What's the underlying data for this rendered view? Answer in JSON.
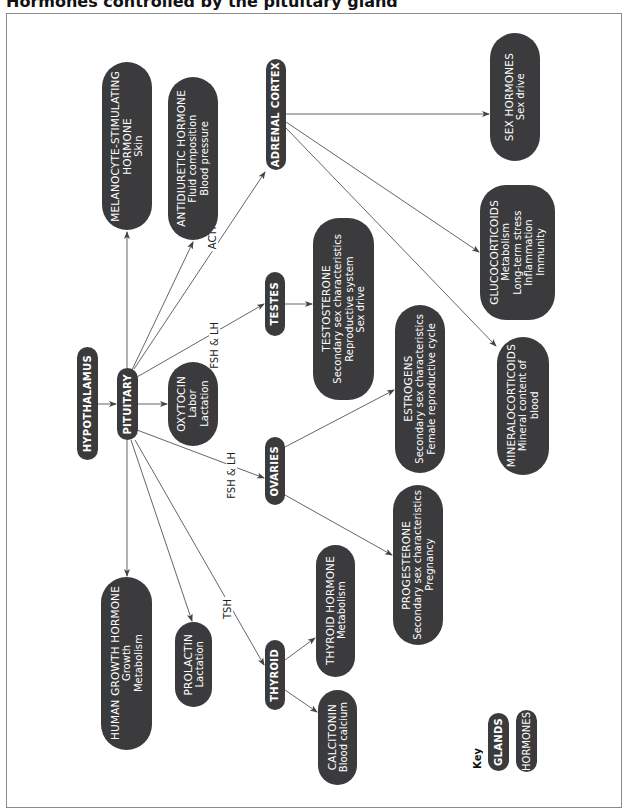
{
  "title": "Hormones controlled by the pituitary gland",
  "colors": {
    "node_fill": "#3b3b3d",
    "node_text": "#ffffff",
    "line": "#555555",
    "frame": "#8a8a8a"
  },
  "glands": {
    "hypothalamus": "HYPOTHALAMUS",
    "pituitary": "PITUITARY",
    "adrenal_cortex": "ADRENAL CORTEX",
    "testes": "TESTES",
    "ovaries": "OVARIES",
    "thyroid": "THYROID"
  },
  "hormones": {
    "msh": {
      "name": "MELANOCYTE-STIMULATING",
      "name2": "HORMONE",
      "effects": [
        "Skin"
      ]
    },
    "adh": {
      "name": "ANTIDIURETIC HORMONE",
      "effects": [
        "Fluid composition",
        "Blood pressure"
      ]
    },
    "oxytocin": {
      "name": "OXYTOCIN",
      "effects": [
        "Labor",
        "Lactation"
      ]
    },
    "hgh": {
      "name": "HUMAN GROWTH HORMONE",
      "effects": [
        "Growth",
        "Metabolism"
      ]
    },
    "prolactin": {
      "name": "PROLACTIN",
      "effects": [
        "Lactation"
      ]
    },
    "testosterone": {
      "name": "TESTOSTERONE",
      "effects": [
        "Secondary sex characteristics",
        "Reproductive system",
        "Sex drive"
      ]
    },
    "estrogens": {
      "name": "ESTROGENS",
      "effects": [
        "Secondary sex characteristics",
        "Female reproductive cycle"
      ]
    },
    "progesterone": {
      "name": "PROGESTERONE",
      "effects": [
        "Secondary sex characteristics",
        "Pregnancy"
      ]
    },
    "thyroid_hormone": {
      "name": "THYROID HORMONE",
      "effects": [
        "Metabolism"
      ]
    },
    "calcitonin": {
      "name": "CALCITONIN",
      "effects": [
        "Blood calcium"
      ]
    },
    "sex_hormones": {
      "name": "SEX HORMONES",
      "effects": [
        "Sex drive"
      ]
    },
    "glucocorticoids": {
      "name": "GLUCOCORTICOIDS",
      "effects": [
        "Metabolism",
        "Long-term stress",
        "Inflammation",
        "Immunity"
      ]
    },
    "mineralocorticoids": {
      "name": "MINERALOCORTICOIDS",
      "effects": [
        "Mineral content of",
        "blood"
      ]
    }
  },
  "edge_labels": {
    "acth": "ACTH",
    "fsh_lh_testes": "FSH & LH",
    "fsh_lh_ovaries": "FSH & LH",
    "tsh": "TSH"
  },
  "key": {
    "label": "Key",
    "glands": "GLANDS",
    "hormones": "HORMONES"
  }
}
